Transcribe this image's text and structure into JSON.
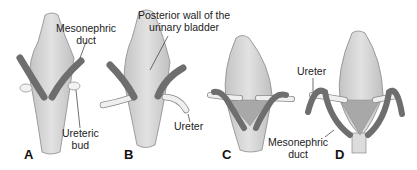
{
  "figure": {
    "panels": [
      {
        "id": "A",
        "label": "A"
      },
      {
        "id": "B",
        "label": "B"
      },
      {
        "id": "C",
        "label": "C"
      },
      {
        "id": "D",
        "label": "D"
      }
    ],
    "annotations": {
      "a_duct_line1": "Mesonephric",
      "a_duct_line2": "duct",
      "a_bud_line1": "Ureteric",
      "a_bud_line2": "bud",
      "b_wall_line1": "Posterior wall of the",
      "b_wall_line2": "urinary bladder",
      "b_ureter": "Ureter",
      "d_ureter": "Ureter",
      "d_duct_line1": "Mesonephric",
      "d_duct_line2": "duct"
    },
    "colors": {
      "bladder": "#d9d9d9",
      "bladder_outline": "#8a8a8a",
      "duct": "#6e6e6e",
      "ureter": "#eeeeee",
      "trigone": "#a8a8a8"
    }
  }
}
